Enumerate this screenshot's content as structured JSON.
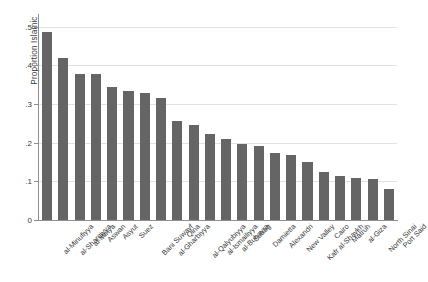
{
  "chart_data": {
    "type": "bar",
    "title": "",
    "subtitle": "",
    "xlabel": "",
    "ylabel": "Proportion Islamic",
    "ylim": [
      0,
      0.52
    ],
    "yticks": [
      0,
      0.1,
      0.2,
      0.3,
      0.4,
      0.5
    ],
    "ytick_labels": [
      "0",
      ".1",
      ".2",
      ".3",
      ".4",
      ".5"
    ],
    "grid": true,
    "legend": "none",
    "orientation": "vertical",
    "bar_color": "#656565",
    "categories": [
      "al-Minufiyya",
      "al-Sharqiyya",
      "al-Minya",
      "Aswan",
      "Asyut",
      "Suez",
      "Bani Suwayf",
      "al-Gharbiyya",
      "Qina",
      "al-Qalyubiyya",
      "al-Ismailiyya",
      "al-Buhayra",
      "Suhag",
      "Damietta",
      "Alexandri",
      "New Valley",
      "Kafr al-Shaykh",
      "Cairo",
      "Matruh",
      "al-Giza",
      "North Sinai",
      "Port Said"
    ],
    "values": [
      0.486,
      0.42,
      0.377,
      0.378,
      0.343,
      0.335,
      0.329,
      0.316,
      0.257,
      0.245,
      0.222,
      0.21,
      0.196,
      0.192,
      0.174,
      0.168,
      0.149,
      0.123,
      0.115,
      0.109,
      0.106,
      0.079
    ]
  },
  "axis": {
    "y_title": "Proportion Islamic"
  }
}
